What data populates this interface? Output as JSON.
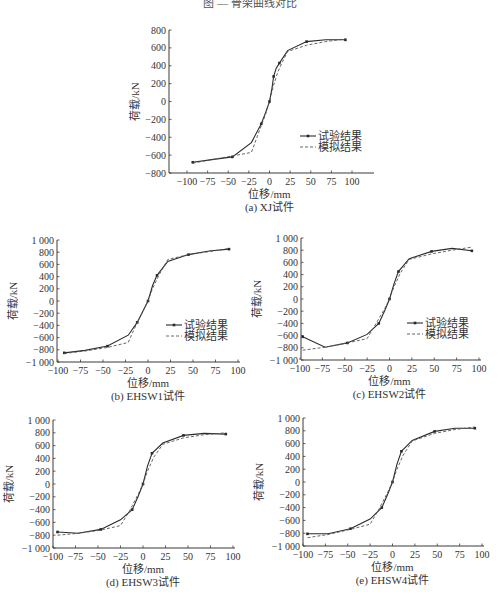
{
  "page_title": "图 — 骨架曲线对比",
  "legend": {
    "test": "试验结果",
    "sim": "模拟结果"
  },
  "chart_data": [
    {
      "id": "a",
      "type": "line",
      "title": "(a) XJ试件",
      "xlabel": "位移/mm",
      "ylabel": "荷载/kN",
      "xlim": [
        -100,
        100
      ],
      "ylim": [
        -800,
        800
      ],
      "xticks": [
        -100,
        -75,
        -50,
        -25,
        0,
        25,
        50,
        75,
        100
      ],
      "yticks": [
        -800,
        -600,
        -400,
        -200,
        0,
        200,
        400,
        600,
        800
      ],
      "ytick_labels": [
        "-800",
        "-600",
        "-400",
        "-200",
        "0",
        "200",
        "400",
        "600",
        "800"
      ],
      "grid": false,
      "legend_position": "lower right",
      "box": {
        "axisX": 169,
        "axisRight": 372,
        "px_m100": 187,
        "px_p100": 352,
        "py_top": 30,
        "py_bot": 173
      },
      "series": [
        {
          "name": "试验结果",
          "style": "solid-marker",
          "x": [
            -93,
            -70,
            -45,
            -22,
            -10,
            -5,
            0,
            3,
            5,
            8,
            12,
            22,
            45,
            68,
            92
          ],
          "y": [
            -680,
            -650,
            -620,
            -460,
            -250,
            -130,
            0,
            150,
            280,
            370,
            430,
            570,
            670,
            690,
            690
          ]
        },
        {
          "name": "模拟结果",
          "style": "dashed",
          "x": [
            -93,
            -70,
            -45,
            -22,
            -12,
            -5,
            0,
            5,
            10,
            15,
            22,
            45,
            68,
            92
          ],
          "y": [
            -690,
            -650,
            -610,
            -570,
            -320,
            -150,
            0,
            180,
            330,
            430,
            560,
            630,
            670,
            700
          ]
        }
      ]
    },
    {
      "id": "b",
      "type": "line",
      "title": "(b) EHSW1试件",
      "xlabel": "位移/mm",
      "ylabel": "荷载/kN",
      "xlim": [
        -100,
        100
      ],
      "ylim": [
        -1000,
        1000
      ],
      "xticks": [
        -100,
        -75,
        -50,
        -25,
        0,
        25,
        50,
        75,
        100
      ],
      "yticks": [
        -1000,
        -800,
        -600,
        -400,
        -200,
        0,
        200,
        400,
        600,
        800,
        1000
      ],
      "ytick_labels": [
        "-1 000",
        "-800",
        "-600",
        "-400",
        "-200",
        "0",
        "200",
        "400",
        "600",
        "800",
        "1 000"
      ],
      "grid": false,
      "legend_position": "lower right",
      "box": {
        "axisX": 57,
        "axisRight": 238,
        "px_m100": 58,
        "px_p100": 238,
        "py_top": 240,
        "py_bot": 362
      },
      "series": [
        {
          "name": "试验结果",
          "style": "solid-marker",
          "x": [
            -93,
            -70,
            -45,
            -22,
            -12,
            -5,
            0,
            5,
            10,
            22,
            45,
            68,
            90
          ],
          "y": [
            -850,
            -810,
            -740,
            -560,
            -350,
            -150,
            0,
            250,
            420,
            650,
            760,
            820,
            850
          ]
        },
        {
          "name": "模拟结果",
          "style": "dashed",
          "x": [
            -93,
            -70,
            -45,
            -22,
            -15,
            -5,
            0,
            5,
            12,
            22,
            45,
            68,
            90
          ],
          "y": [
            -860,
            -820,
            -760,
            -680,
            -450,
            -150,
            0,
            200,
            420,
            680,
            760,
            810,
            860
          ]
        }
      ]
    },
    {
      "id": "c",
      "type": "line",
      "title": "(c) EHSW2试件",
      "xlabel": "位移/mm",
      "ylabel": "荷载/kN",
      "xlim": [
        -100,
        100
      ],
      "ylim": [
        -1000,
        1000
      ],
      "xticks": [
        -100,
        -75,
        -50,
        -25,
        0,
        25,
        50,
        75,
        100
      ],
      "yticks": [
        -1000,
        -800,
        -600,
        -400,
        -200,
        0,
        200,
        400,
        600,
        800,
        1000
      ],
      "ytick_labels": [
        "-1 000",
        "-800",
        "-600",
        "-400",
        "-200",
        "0",
        "200",
        "400",
        "600",
        "800",
        "1 000"
      ],
      "grid": false,
      "legend_position": "lower right",
      "box": {
        "axisX": 301,
        "axisRight": 479,
        "px_m100": 300,
        "px_p100": 479,
        "py_top": 238,
        "py_bot": 360
      },
      "series": [
        {
          "name": "试验结果",
          "style": "solid-marker",
          "x": [
            -97,
            -72,
            -47,
            -25,
            -12,
            -5,
            0,
            5,
            10,
            22,
            47,
            70,
            92
          ],
          "y": [
            -620,
            -790,
            -720,
            -580,
            -400,
            -180,
            0,
            250,
            450,
            660,
            780,
            830,
            790
          ]
        },
        {
          "name": "模拟结果",
          "style": "dashed",
          "x": [
            -97,
            -72,
            -47,
            -25,
            -15,
            -5,
            0,
            5,
            12,
            22,
            47,
            70,
            92
          ],
          "y": [
            -840,
            -790,
            -720,
            -650,
            -400,
            -150,
            0,
            200,
            420,
            650,
            740,
            800,
            850
          ]
        }
      ]
    },
    {
      "id": "d",
      "type": "line",
      "title": "(d) EHSW3试件",
      "xlabel": "位移/mm",
      "ylabel": "荷载/kN",
      "xlim": [
        -100,
        100
      ],
      "ylim": [
        -1000,
        1000
      ],
      "xticks": [
        -100,
        -75,
        -50,
        -25,
        0,
        25,
        50,
        75,
        100
      ],
      "yticks": [
        -1000,
        -800,
        -600,
        -400,
        -200,
        0,
        200,
        400,
        600,
        800,
        1000
      ],
      "ytick_labels": [
        "-1 000",
        "-800",
        "-600",
        "-400",
        "-200",
        "0",
        "200",
        "400",
        "600",
        "800",
        "1 000"
      ],
      "grid": false,
      "legend_position": "none",
      "box": {
        "axisX": 53,
        "axisRight": 233,
        "px_m100": 53,
        "px_p100": 233,
        "py_top": 420,
        "py_bot": 548
      },
      "series": [
        {
          "name": "试验结果",
          "style": "solid-marker",
          "x": [
            -95,
            -72,
            -47,
            -25,
            -12,
            -5,
            0,
            5,
            10,
            22,
            45,
            68,
            92
          ],
          "y": [
            -750,
            -770,
            -710,
            -560,
            -400,
            -180,
            0,
            280,
            480,
            640,
            760,
            790,
            780
          ]
        },
        {
          "name": "模拟结果",
          "style": "dashed",
          "x": [
            -95,
            -72,
            -47,
            -25,
            -15,
            -5,
            0,
            5,
            12,
            22,
            45,
            68,
            92
          ],
          "y": [
            -800,
            -770,
            -720,
            -650,
            -420,
            -150,
            0,
            200,
            420,
            620,
            720,
            770,
            800
          ]
        }
      ]
    },
    {
      "id": "e",
      "type": "line",
      "title": "(e) EHSW4试件",
      "xlabel": "位移/mm",
      "ylabel": "荷载/kN",
      "xlim": [
        -100,
        100
      ],
      "ylim": [
        -1000,
        1000
      ],
      "xticks": [
        -100,
        -75,
        -50,
        -25,
        0,
        25,
        50,
        75,
        100
      ],
      "yticks": [
        -1000,
        -800,
        -600,
        -400,
        -200,
        0,
        200,
        400,
        600,
        800,
        1000
      ],
      "ytick_labels": [
        "-1 000",
        "-800",
        "-600",
        "-400",
        "-200",
        "0",
        "200",
        "400",
        "600",
        "800",
        "1 000"
      ],
      "grid": false,
      "legend_position": "none",
      "box": {
        "axisX": 303,
        "axisRight": 482,
        "px_m100": 303,
        "px_p100": 482,
        "py_top": 418,
        "py_bot": 546
      },
      "series": [
        {
          "name": "试验结果",
          "style": "solid-marker",
          "x": [
            -95,
            -72,
            -47,
            -25,
            -12,
            -5,
            0,
            5,
            10,
            22,
            47,
            70,
            92
          ],
          "y": [
            -810,
            -810,
            -730,
            -580,
            -400,
            -180,
            0,
            280,
            480,
            650,
            790,
            840,
            840
          ]
        },
        {
          "name": "模拟结果",
          "style": "dashed",
          "x": [
            -95,
            -72,
            -47,
            -25,
            -15,
            -5,
            0,
            5,
            12,
            22,
            47,
            70,
            92
          ],
          "y": [
            -870,
            -820,
            -740,
            -660,
            -420,
            -150,
            0,
            200,
            420,
            640,
            760,
            820,
            860
          ]
        }
      ]
    }
  ]
}
